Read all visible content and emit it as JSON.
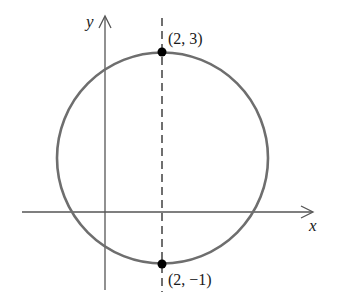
{
  "diagram": {
    "type": "circle-on-coordinate-plane",
    "axes": {
      "x_label": "x",
      "y_label": "y",
      "color": "#555555"
    },
    "circle": {
      "color": "#6e6e6e",
      "center_px": [
        162.5,
        158
      ],
      "radius_px": 105.5
    },
    "dashed_line": {
      "x": 2,
      "color": "#333333"
    },
    "points": [
      {
        "label": "(2, 3)",
        "x": 2,
        "y": 3
      },
      {
        "label": "(2, −1)",
        "x": 2,
        "y": -1
      }
    ]
  }
}
